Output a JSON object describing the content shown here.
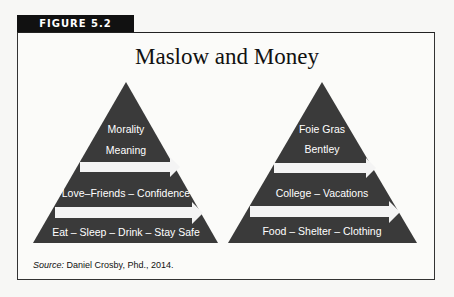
{
  "figure_label": "FIGURE 5.2",
  "title": "Maslow and Money",
  "pyramids": [
    {
      "name": "maslow",
      "top": [
        "Morality",
        "Meaning"
      ],
      "middle": "Love–Friends – Confidence",
      "bottom": "Eat – Sleep – Drink – Stay Safe"
    },
    {
      "name": "money",
      "top": [
        "Foie Gras",
        "Bentley"
      ],
      "middle": "College – Vacations",
      "bottom": "Food – Shelter – Clothing"
    }
  ],
  "source": {
    "label": "Source:",
    "text": " Daniel Crosby, Phd., 2014."
  },
  "colors": {
    "pyramid_fill": "#3a3a3a",
    "arrow_fill": "#f4f4f4",
    "tab_bg": "#111111"
  }
}
